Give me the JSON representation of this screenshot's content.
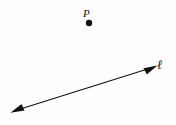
{
  "figure": {
    "background_color": "#fefefe",
    "ink_color": "#111111",
    "width": 176,
    "height": 125
  },
  "point": {
    "label": "P",
    "marker_name": "filled-dot",
    "cx": 89,
    "cy": 23,
    "radius": 3.2,
    "label_x": 83,
    "label_y": 8
  },
  "line": {
    "label": "ℓ",
    "label_x": 157,
    "label_y": 58,
    "style": "double-headed-arrow",
    "x1": 11,
    "y1": 112,
    "x2": 157,
    "y2": 66,
    "stroke_width": 1.1,
    "arrow_left": "down-left",
    "arrow_right": "up-right"
  }
}
